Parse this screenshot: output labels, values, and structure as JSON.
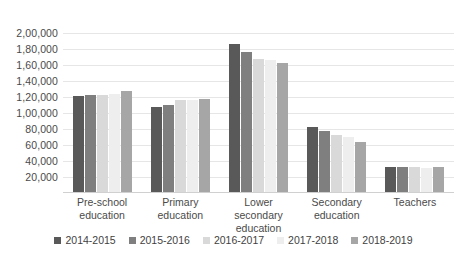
{
  "chart_data": {
    "type": "bar",
    "title": "",
    "xlabel": "",
    "ylabel": "",
    "ylim": [
      0,
      200000
    ],
    "ytick_step": 20000,
    "grid": true,
    "legend_position": "bottom",
    "number_format": "indian",
    "categories": [
      "Pre-school education",
      "Primary education",
      "Lower secondary education",
      "Secondary education",
      "Teachers"
    ],
    "y_tick_labels": [
      "2,00,000",
      "1,80,000",
      "1,60,000",
      "1,40,000",
      "1,20,000",
      "1,00,000",
      "80,000",
      "60,000",
      "40,000",
      "20,000"
    ],
    "y_tick_values": [
      200000,
      180000,
      160000,
      140000,
      120000,
      100000,
      80000,
      60000,
      40000,
      20000
    ],
    "series": [
      {
        "name": "2014-2015",
        "color": "#595959",
        "values": [
          121000,
          108000,
          186000,
          82000,
          33000
        ]
      },
      {
        "name": "2015-2016",
        "color": "#7f7f7f",
        "values": [
          123000,
          110000,
          176000,
          78000,
          33000
        ]
      },
      {
        "name": "2016-2017",
        "color": "#d9d9d9",
        "values": [
          123000,
          116000,
          168000,
          73000,
          32000
        ]
      },
      {
        "name": "2017-2018",
        "color": "#eeeeee",
        "values": [
          124000,
          116000,
          166000,
          70000,
          31000
        ]
      },
      {
        "name": "2018-2019",
        "color": "#a6a6a6",
        "values": [
          128000,
          117000,
          163000,
          64000,
          32000
        ]
      }
    ]
  }
}
